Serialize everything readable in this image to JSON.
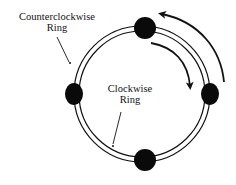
{
  "diagram": {
    "labels": {
      "counterclockwise_ring": {
        "line1": "Counterclockwise",
        "line2": "Ring"
      },
      "clockwise_ring": {
        "line1": "Clockwise",
        "line2": "Ring"
      }
    },
    "rings": [
      {
        "name": "outer-ring",
        "direction": "counterclockwise",
        "cx": 142,
        "cy": 94,
        "r": 68
      },
      {
        "name": "inner-ring",
        "direction": "clockwise",
        "cx": 142,
        "cy": 94,
        "r": 63
      }
    ],
    "nodes": [
      {
        "name": "node-top",
        "cx": 145,
        "cy": 28,
        "rx": 10,
        "ry": 10
      },
      {
        "name": "node-left",
        "cx": 74,
        "cy": 94,
        "rx": 9,
        "ry": 11
      },
      {
        "name": "node-right",
        "cx": 210,
        "cy": 94,
        "rx": 9,
        "ry": 11
      },
      {
        "name": "node-bottom",
        "cx": 145,
        "cy": 160,
        "rx": 11,
        "ry": 11
      }
    ],
    "arrows": [
      {
        "name": "counterclockwise-arrow",
        "meaning": "outer ring flows counterclockwise"
      },
      {
        "name": "clockwise-arrow",
        "meaning": "inner ring flows clockwise"
      }
    ],
    "colors": {
      "line": "#111111",
      "node": "#0a0a0a",
      "background": "#ffffff"
    }
  }
}
